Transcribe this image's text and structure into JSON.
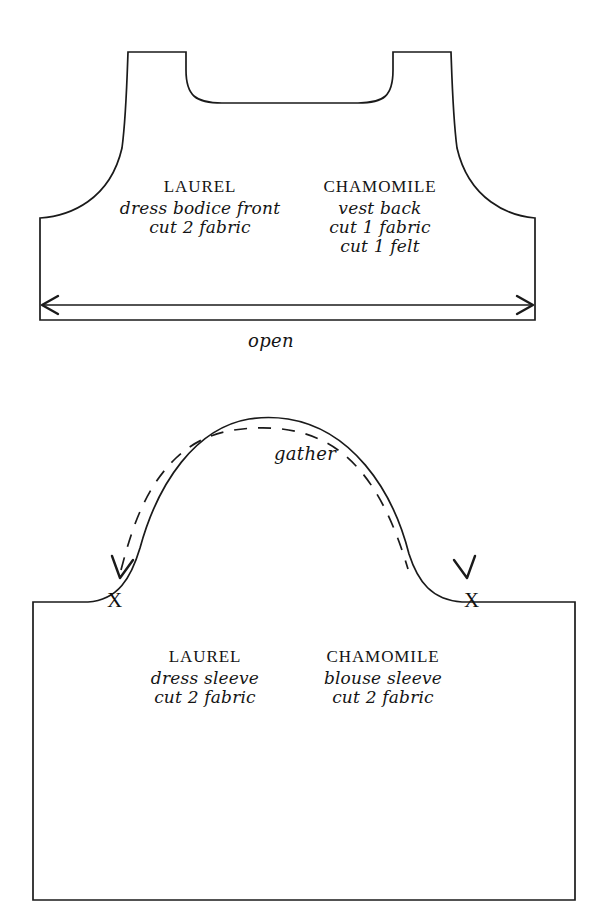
{
  "document": {
    "title": "Sewing Pattern Pieces",
    "line_color": "#1a1a1a",
    "background_color": "#ffffff"
  },
  "pieces": [
    {
      "id": "bodice",
      "shape": "dress-bodice-front",
      "labels": [
        {
          "pattern_name": "LAUREL",
          "piece_name": "dress bodice front",
          "cut_instructions": [
            "cut 2 fabric"
          ]
        },
        {
          "pattern_name": "CHAMOMILE",
          "piece_name": "vest back",
          "cut_instructions": [
            "cut 1 fabric",
            "cut 1 felt"
          ]
        }
      ],
      "annotations": [
        {
          "name": "open-dimension-label",
          "text": "open"
        }
      ]
    },
    {
      "id": "sleeve",
      "shape": "sleeve",
      "labels": [
        {
          "pattern_name": "LAUREL",
          "piece_name": "dress sleeve",
          "cut_instructions": [
            "cut 2 fabric"
          ]
        },
        {
          "pattern_name": "CHAMOMILE",
          "piece_name": "blouse sleeve",
          "cut_instructions": [
            "cut 2 fabric"
          ]
        }
      ],
      "annotations": [
        {
          "name": "gather-label",
          "text": "gather"
        },
        {
          "name": "notch-left",
          "text": "X"
        },
        {
          "name": "notch-right",
          "text": "X"
        }
      ]
    }
  ]
}
